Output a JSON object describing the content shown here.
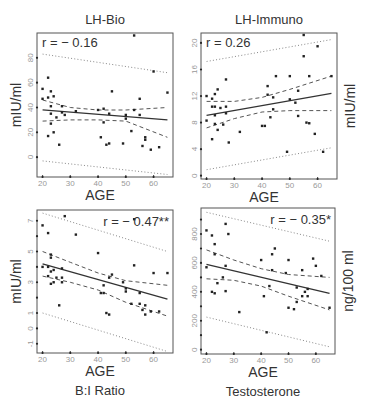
{
  "chart_data": [
    {
      "type": "scatter",
      "title": "LH-Bio",
      "xlabel": "AGE",
      "ylabel": "mIU/ml",
      "ylabel_side": "left",
      "caption": "",
      "annotation": "r = − 0.16",
      "annotation_pos": "top-left",
      "xlim": [
        18,
        67
      ],
      "ylim": [
        -16,
        100
      ],
      "xticks": [
        20,
        30,
        40,
        50,
        60
      ],
      "yticks": [
        0,
        20,
        40,
        60,
        80
      ],
      "grid": false,
      "regression": {
        "x": [
          20,
          65
        ],
        "y": [
          38,
          30
        ]
      },
      "ci_inner": {
        "upper": {
          "x": [
            20,
            30,
            40,
            50,
            65
          ],
          "y": [
            46,
            40,
            38,
            38,
            40
          ]
        },
        "lower": {
          "x": [
            20,
            30,
            40,
            50,
            65
          ],
          "y": [
            29,
            30,
            30,
            29,
            16
          ]
        }
      },
      "ci_outer": {
        "upper": {
          "x": [
            20,
            65
          ],
          "y": [
            83,
            68
          ]
        },
        "lower": {
          "x": [
            20,
            65
          ],
          "y": [
            -3,
            -14
          ]
        }
      },
      "points": [
        [
          20,
          55
        ],
        [
          20,
          47
        ],
        [
          22,
          64
        ],
        [
          22,
          48
        ],
        [
          23,
          53
        ],
        [
          23,
          41
        ],
        [
          23,
          35
        ],
        [
          23,
          27
        ],
        [
          22,
          17
        ],
        [
          24,
          49
        ],
        [
          24,
          20
        ],
        [
          25,
          32
        ],
        [
          26,
          10
        ],
        [
          27,
          41
        ],
        [
          27,
          36
        ],
        [
          28,
          34
        ],
        [
          32,
          37
        ],
        [
          40,
          38
        ],
        [
          41,
          16
        ],
        [
          42,
          39
        ],
        [
          42,
          28
        ],
        [
          43,
          10
        ],
        [
          44,
          35
        ],
        [
          44,
          11
        ],
        [
          45,
          53
        ],
        [
          49,
          11
        ],
        [
          50,
          34
        ],
        [
          50,
          31
        ],
        [
          52,
          21
        ],
        [
          53,
          38
        ],
        [
          53,
          98
        ],
        [
          55,
          34
        ],
        [
          55,
          47
        ],
        [
          56,
          9
        ],
        [
          57,
          16
        ],
        [
          57,
          14
        ],
        [
          59,
          6
        ],
        [
          60,
          69
        ],
        [
          62,
          8
        ],
        [
          65,
          52
        ]
      ]
    },
    {
      "type": "scatter",
      "title": "LH-Immuno",
      "xlabel": "AGE",
      "ylabel": "mIU/ml",
      "ylabel_side": "right",
      "caption": "",
      "annotation": "r = 0.26",
      "annotation_pos": "top-left",
      "xlim": [
        18,
        67
      ],
      "ylim": [
        -0.5,
        21.5
      ],
      "xticks": [
        20,
        30,
        40,
        50,
        60
      ],
      "yticks": [
        0,
        4,
        8,
        12,
        16,
        20
      ],
      "grid": false,
      "regression": {
        "x": [
          20,
          65
        ],
        "y": [
          9.1,
          12.4
        ]
      },
      "ci_inner": {
        "upper": {
          "x": [
            20,
            30,
            40,
            50,
            65
          ],
          "y": [
            11.2,
            11.2,
            11.8,
            13,
            15
          ]
        },
        "lower": {
          "x": [
            20,
            30,
            40,
            50,
            65
          ],
          "y": [
            7.2,
            8.6,
            9.6,
            9.8,
            9.8
          ]
        }
      },
      "ci_outer": {
        "upper": {
          "x": [
            20,
            65
          ],
          "y": [
            17.2,
            20.5
          ]
        },
        "lower": {
          "x": [
            20,
            65
          ],
          "y": [
            0.9,
            4.2
          ]
        }
      },
      "points": [
        [
          20,
          12
        ],
        [
          20,
          8.3
        ],
        [
          22,
          11.6
        ],
        [
          22,
          10.4
        ],
        [
          22,
          5.5
        ],
        [
          23,
          12.3
        ],
        [
          23,
          10.4
        ],
        [
          23,
          9.1
        ],
        [
          23,
          7.8
        ],
        [
          24,
          13
        ],
        [
          24,
          6.9
        ],
        [
          25,
          10.2
        ],
        [
          26,
          7.7
        ],
        [
          27,
          14.5
        ],
        [
          27,
          10.4
        ],
        [
          27,
          9.4
        ],
        [
          28,
          5
        ],
        [
          32,
          6.6
        ],
        [
          40,
          7.5
        ],
        [
          41,
          7.5
        ],
        [
          42,
          13.5
        ],
        [
          42,
          12.2
        ],
        [
          43,
          8.8
        ],
        [
          44,
          11.8
        ],
        [
          44,
          10
        ],
        [
          45,
          15
        ],
        [
          49,
          3.6
        ],
        [
          50,
          15
        ],
        [
          50,
          11.5
        ],
        [
          52,
          11
        ],
        [
          53,
          12.8
        ],
        [
          53,
          9
        ],
        [
          55,
          21.2
        ],
        [
          55,
          18
        ],
        [
          56,
          8
        ],
        [
          57,
          15
        ],
        [
          57,
          7.9
        ],
        [
          59,
          6.3
        ],
        [
          60,
          19.5
        ],
        [
          62,
          3.6
        ],
        [
          65,
          15
        ]
      ]
    },
    {
      "type": "scatter",
      "title": "",
      "xlabel": "AGE",
      "ylabel": "mIU/ml",
      "ylabel_side": "left",
      "caption": "B:I Ratio",
      "annotation": "r = − 0.47**",
      "annotation_pos": "top-right",
      "xlim": [
        18,
        67
      ],
      "ylim": [
        -1.6,
        7.7
      ],
      "xticks": [
        20,
        30,
        40,
        50,
        60
      ],
      "yticks": [
        -1,
        0,
        1,
        2,
        3,
        4,
        5,
        6,
        7
      ],
      "ytick_labels": [
        "-1",
        "0",
        "1",
        "",
        "3",
        "",
        "5",
        "",
        "7"
      ],
      "grid": false,
      "regression": {
        "x": [
          20,
          65
        ],
        "y": [
          4.2,
          1.9
        ]
      },
      "ci_inner": {
        "upper": {
          "x": [
            20,
            30,
            40,
            50,
            65
          ],
          "y": [
            5,
            4.3,
            3.6,
            3.1,
            2.8
          ]
        },
        "lower": {
          "x": [
            20,
            30,
            40,
            50,
            65
          ],
          "y": [
            3.4,
            3,
            2.5,
            1.7,
            0.8
          ]
        }
      },
      "ci_outer": {
        "upper": {
          "x": [
            20,
            65
          ],
          "y": [
            7.5,
            5
          ]
        },
        "lower": {
          "x": [
            20,
            65
          ],
          "y": [
            1,
            -1.5
          ]
        }
      },
      "points": [
        [
          20,
          6.7
        ],
        [
          20,
          4
        ],
        [
          22,
          6.2
        ],
        [
          22,
          3.4
        ],
        [
          22,
          4
        ],
        [
          23,
          4.8
        ],
        [
          23,
          4.6
        ],
        [
          23,
          3.7
        ],
        [
          23,
          2.9
        ],
        [
          24,
          3.8
        ],
        [
          24,
          3
        ],
        [
          25,
          3.3
        ],
        [
          26,
          1.5
        ],
        [
          27,
          3.3
        ],
        [
          27,
          3
        ],
        [
          27,
          3.9
        ],
        [
          28,
          7.3
        ],
        [
          32,
          6.1
        ],
        [
          40,
          4.9
        ],
        [
          41,
          2.3
        ],
        [
          42,
          2.3
        ],
        [
          42,
          2.8
        ],
        [
          43,
          1
        ],
        [
          44,
          3.3
        ],
        [
          44,
          0.9
        ],
        [
          45,
          3.5
        ],
        [
          49,
          3
        ],
        [
          50,
          2.4
        ],
        [
          50,
          2.6
        ],
        [
          52,
          1.6
        ],
        [
          53,
          7.1
        ],
        [
          53,
          4.1
        ],
        [
          55,
          2.3
        ],
        [
          55,
          1.6
        ],
        [
          56,
          1.2
        ],
        [
          57,
          1.5
        ],
        [
          57,
          0.9
        ],
        [
          59,
          1.1
        ],
        [
          60,
          3.6
        ],
        [
          62,
          1.1
        ],
        [
          65,
          3.6
        ]
      ]
    },
    {
      "type": "scatter",
      "title": "",
      "xlabel": "AGE",
      "ylabel": "ng/100 ml",
      "ylabel_side": "right",
      "caption": "Testosterone",
      "annotation": "r = − 0.35*",
      "annotation_pos": "top-right",
      "xlim": [
        18,
        67
      ],
      "ylim": [
        -30,
        980
      ],
      "xticks": [
        20,
        30,
        40,
        50,
        60
      ],
      "yticks": [
        0,
        100,
        200,
        300,
        400,
        500,
        600,
        700,
        800,
        900
      ],
      "ytick_labels": [
        "0",
        "",
        "200",
        "",
        "400",
        "",
        "600",
        "",
        "800",
        ""
      ],
      "grid": false,
      "regression": {
        "x": [
          20,
          65
        ],
        "y": [
          590,
          390
        ]
      },
      "ci_inner": {
        "upper": {
          "x": [
            20,
            30,
            40,
            50,
            65
          ],
          "y": [
            690,
            620,
            560,
            520,
            500
          ]
        },
        "lower": {
          "x": [
            20,
            30,
            40,
            50,
            65
          ],
          "y": [
            490,
            480,
            440,
            370,
            275
          ]
        }
      },
      "ci_outer": {
        "upper": {
          "x": [
            20,
            65
          ],
          "y": [
            950,
            750
          ]
        },
        "lower": {
          "x": [
            20,
            65
          ],
          "y": [
            225,
            20
          ]
        }
      },
      "points": [
        [
          20,
          825
        ],
        [
          20,
          570
        ],
        [
          22,
          790
        ],
        [
          22,
          400
        ],
        [
          23,
          730
        ],
        [
          23,
          390
        ],
        [
          23,
          660
        ],
        [
          24,
          460
        ],
        [
          26,
          500
        ],
        [
          27,
          870
        ],
        [
          27,
          580
        ],
        [
          27,
          405
        ],
        [
          28,
          800
        ],
        [
          32,
          260
        ],
        [
          40,
          620
        ],
        [
          41,
          370
        ],
        [
          42,
          120
        ],
        [
          43,
          440
        ],
        [
          44,
          660
        ],
        [
          44,
          550
        ],
        [
          45,
          700
        ],
        [
          49,
          530
        ],
        [
          50,
          620
        ],
        [
          50,
          290
        ],
        [
          52,
          280
        ],
        [
          53,
          430
        ],
        [
          53,
          330
        ],
        [
          55,
          550
        ],
        [
          55,
          370
        ],
        [
          56,
          400
        ],
        [
          57,
          420
        ],
        [
          57,
          370
        ],
        [
          59,
          630
        ],
        [
          60,
          580
        ],
        [
          62,
          510
        ],
        [
          65,
          290
        ]
      ]
    }
  ],
  "panels": [
    {
      "title": "LH-Bio",
      "annotation": "r = − 0.16",
      "xlabel": "AGE",
      "ylabel": "mIU/ml",
      "caption": ""
    },
    {
      "title": "LH-Immuno",
      "annotation": "r = 0.26",
      "xlabel": "AGE",
      "ylabel": "mIU/ml",
      "caption": ""
    },
    {
      "title": "",
      "annotation": "r = − 0.47**",
      "xlabel": "AGE",
      "ylabel": "mIU/ml",
      "caption": "B:I Ratio"
    },
    {
      "title": "",
      "annotation": "r = − 0.35*",
      "xlabel": "AGE",
      "ylabel": "ng/100 ml",
      "caption": "Testosterone"
    }
  ],
  "colors": {
    "frame": "#555555",
    "point": "#222222",
    "regression": "#333333",
    "ci_inner": "#555555",
    "ci_outer": "#888888",
    "tick_label": "#999999",
    "text": "#333333"
  }
}
